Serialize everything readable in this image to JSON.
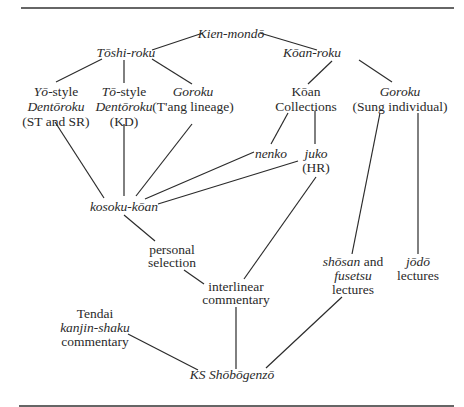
{
  "diagram": {
    "nodes": {
      "kien_mondo": {
        "lines": [
          "Kien-mondō"
        ]
      },
      "toshi_roku": {
        "lines": [
          "Tōshi-roku"
        ]
      },
      "koan_roku": {
        "lines": [
          "Kōan-roku"
        ]
      },
      "yo_style": {
        "lines": [
          "Yō-style",
          "Dentōroku",
          "(ST and SR)"
        ],
        "prefix_italic": "Yō",
        "suffix": "-style"
      },
      "to_style": {
        "lines": [
          "Tō-style",
          "Dentōroku",
          "(KD)"
        ],
        "prefix_italic": "Tō",
        "suffix": "-style"
      },
      "goroku_tang": {
        "lines": [
          "Goroku",
          "(T'ang lineage)"
        ]
      },
      "koan_collections": {
        "lines": [
          "Kōan",
          "Collections"
        ]
      },
      "goroku_sung": {
        "lines": [
          "Goroku",
          "(Sung individual)"
        ]
      },
      "nenko": {
        "lines": [
          "nenko"
        ]
      },
      "juko": {
        "lines": [
          "juko",
          "(HR)"
        ]
      },
      "kosoku_koan": {
        "lines": [
          "kosoku-kōan"
        ]
      },
      "personal_selection": {
        "lines": [
          "personal",
          "selection"
        ]
      },
      "interlinear_commentary": {
        "lines": [
          "interlinear",
          "commentary"
        ]
      },
      "shosan_fusetsu": {
        "lines": [
          "shōsan and",
          "fusetsu",
          "lectures"
        ],
        "italic_a": "shōsan",
        "plain_a": " and"
      },
      "jodo": {
        "lines": [
          "jōdō",
          "lectures"
        ]
      },
      "tendai": {
        "lines": [
          "Tendai",
          "kanjin-shaku",
          "commentary"
        ]
      },
      "ks_shobogenzo": {
        "lines": [
          "KS Shōbōgenzō"
        ]
      }
    },
    "edges": [
      [
        "kien_mondo",
        "toshi_roku"
      ],
      [
        "kien_mondo",
        "koan_roku"
      ],
      [
        "toshi_roku",
        "yo_style"
      ],
      [
        "toshi_roku",
        "to_style"
      ],
      [
        "toshi_roku",
        "goroku_tang"
      ],
      [
        "koan_roku",
        "koan_collections"
      ],
      [
        "koan_roku",
        "goroku_sung"
      ],
      [
        "koan_collections",
        "nenko"
      ],
      [
        "koan_collections",
        "juko"
      ],
      [
        "yo_style",
        "kosoku_koan"
      ],
      [
        "to_style",
        "kosoku_koan"
      ],
      [
        "goroku_tang",
        "kosoku_koan"
      ],
      [
        "nenko",
        "kosoku_koan"
      ],
      [
        "juko",
        "kosoku_koan"
      ],
      [
        "kosoku_koan",
        "personal_selection"
      ],
      [
        "personal_selection",
        "interlinear_commentary"
      ],
      [
        "juko",
        "interlinear_commentary"
      ],
      [
        "goroku_sung",
        "shosan_fusetsu"
      ],
      [
        "goroku_sung",
        "jodo"
      ],
      [
        "interlinear_commentary",
        "ks_shobogenzo"
      ],
      [
        "tendai",
        "ks_shobogenzo"
      ],
      [
        "shosan_fusetsu",
        "ks_shobogenzo"
      ]
    ]
  }
}
